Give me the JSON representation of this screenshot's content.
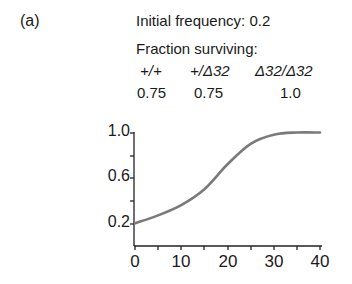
{
  "panel_label": "(a)",
  "info": {
    "initial_frequency_label": "Initial frequency: 0.2",
    "fraction_label": "Fraction surviving:",
    "genotypes": [
      "+/+",
      "+/Δ32",
      "Δ32/Δ32"
    ],
    "survival": [
      "0.75",
      "0.75",
      "1.0"
    ]
  },
  "chart_data": {
    "type": "line",
    "title": "Initial frequency: 0.2",
    "subtitle": "Fraction surviving: +/+ 0.75, +/Δ32 0.75, Δ32/Δ32 1.0",
    "xlabel": "",
    "ylabel": "",
    "xlim": [
      0,
      40
    ],
    "ylim": [
      0,
      1.0
    ],
    "x_ticks": [
      "0",
      "10",
      "20",
      "30",
      "40"
    ],
    "y_ticks": [
      "0.2",
      "0.6",
      "1.0"
    ],
    "grid": false,
    "series": [
      {
        "name": "Δ32 allele frequency",
        "color": "#7a7a7a",
        "x": [
          0,
          5,
          10,
          15,
          20,
          25,
          30,
          35,
          40
        ],
        "values": [
          0.2,
          0.27,
          0.36,
          0.5,
          0.72,
          0.9,
          0.98,
          1.0,
          1.0
        ]
      }
    ]
  }
}
